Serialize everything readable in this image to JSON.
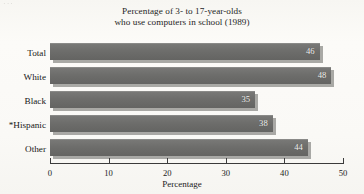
{
  "artifact": {
    "top_left_fragment": "···"
  },
  "chart_data": {
    "type": "bar",
    "orientation": "horizontal",
    "title": "Percentage of 3- to 17-year-olds who use computers in school (1989)",
    "title_lines": [
      "Percentage of 3- to 17-year-olds",
      "who use computers in school (1989)"
    ],
    "categories": [
      "Total",
      "White",
      "Black",
      "*Hispanic",
      "Other"
    ],
    "values": [
      46,
      48,
      35,
      38,
      44
    ],
    "value_labels": [
      "46",
      "48",
      "35",
      "38",
      "44"
    ],
    "xlabel": "Percentage",
    "ylabel": "",
    "xlim": [
      0,
      50
    ],
    "xticks": [
      0,
      10,
      20,
      30,
      40,
      50
    ],
    "xtick_labels": [
      "0",
      "10",
      "20",
      "30",
      "40",
      "50"
    ],
    "grid": false,
    "legend": false,
    "bar_color": "#6d6d6b",
    "bar_shadow_color": "#9a9a97",
    "value_label_color": "#f2f2f0",
    "axis_color": "#3b3b3b",
    "background_color": "#faf9f6",
    "footnote_marker": "*",
    "footnote_category": "*Hispanic"
  }
}
